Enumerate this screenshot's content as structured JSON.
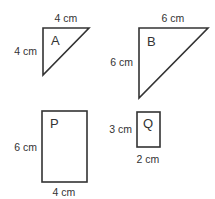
{
  "diagram": {
    "stroke_color": "#333333",
    "shapes": [
      {
        "id": "A",
        "type": "right-triangle",
        "name": "A",
        "top_label": "4 cm",
        "side_label": "4 cm",
        "points": [
          [
            43,
            28
          ],
          [
            89,
            28
          ],
          [
            43,
            75
          ]
        ]
      },
      {
        "id": "B",
        "type": "right-triangle",
        "name": "B",
        "top_label": "6 cm",
        "side_label": "6 cm",
        "points": [
          [
            139,
            28
          ],
          [
            208,
            28
          ],
          [
            139,
            98
          ]
        ]
      },
      {
        "id": "P",
        "type": "rectangle",
        "name": "P",
        "side_label": "6 cm",
        "bottom_label": "4 cm",
        "rect": [
          42,
          111,
          45,
          71
        ]
      },
      {
        "id": "Q",
        "type": "rectangle",
        "name": "Q",
        "side_label": "3 cm",
        "bottom_label": "2 cm",
        "rect": [
          137,
          112,
          23,
          35
        ]
      }
    ]
  }
}
